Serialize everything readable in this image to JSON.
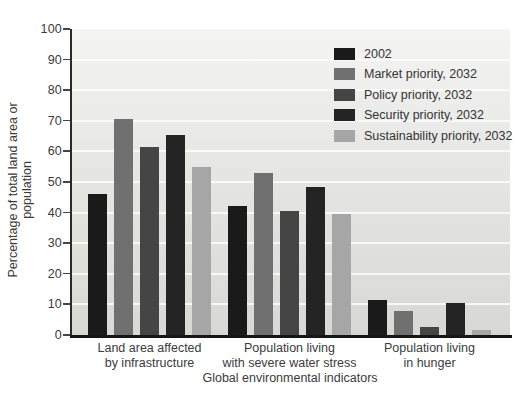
{
  "chart_data": {
    "type": "bar",
    "title": "",
    "xlabel": "Global environmental indicators",
    "ylabel": "Percentage of total land area or population",
    "ylim": [
      0,
      100
    ],
    "ytick_labels": [
      "0",
      "10",
      "20",
      "30",
      "40",
      "50",
      "60",
      "70",
      "80",
      "90",
      "100"
    ],
    "grid": true,
    "legend_position": "top-right-inside",
    "categories": [
      {
        "line1": "Land area affected",
        "line2": "by infrastructure"
      },
      {
        "line1": "Population living",
        "line2": "with severe water stress"
      },
      {
        "line1": "Population living",
        "line2": "in hunger"
      }
    ],
    "series": [
      {
        "name": "2002",
        "color": "#1a1a1a",
        "values": [
          46,
          42,
          11.5
        ]
      },
      {
        "name": "Market priority, 2032",
        "color": "#707070",
        "values": [
          70.5,
          53,
          8
        ]
      },
      {
        "name": "Policy priority, 2032",
        "color": "#454545",
        "values": [
          61.5,
          40.5,
          2.5
        ]
      },
      {
        "name": "Security priority, 2032",
        "color": "#242424",
        "values": [
          65.5,
          48.5,
          10.5
        ]
      },
      {
        "name": "Sustainability priority, 2032",
        "color": "#a6a6a6",
        "values": [
          55,
          39.5,
          1.5
        ]
      }
    ]
  }
}
